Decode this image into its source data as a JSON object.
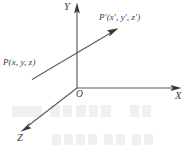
{
  "figure": {
    "kind": "3d-cartesian-coordinate-diagram",
    "background_color": "#ffffff",
    "line_color": "#5a5a5a",
    "text_color": "#3d3d3d",
    "width": 189,
    "height": 158
  },
  "axes": {
    "y": {
      "label": "Y",
      "direction": "up",
      "origin": {
        "x": 77,
        "y": 88
      },
      "tip": {
        "x": 77,
        "y": 4
      }
    },
    "x": {
      "label": "X",
      "direction": "right",
      "origin": {
        "x": 77,
        "y": 88
      },
      "tip": {
        "x": 181,
        "y": 88
      }
    },
    "z": {
      "label": "Z",
      "direction": "down-left",
      "origin": {
        "x": 77,
        "y": 88
      },
      "tip": {
        "x": 21,
        "y": 131
      }
    }
  },
  "origin": {
    "label": "O",
    "x": 77,
    "y": 88
  },
  "points": {
    "p": {
      "label": "P(x, y, z)",
      "name": "P",
      "coordinates": "(x, y, z)"
    },
    "p_prime": {
      "label": "P′(x′, y′, z′)",
      "name": "P′",
      "coordinates": "(x′, y′, z′)"
    }
  },
  "vector": {
    "description": "arrow from P to P-prime",
    "from": {
      "x": 32,
      "y": 79
    },
    "to": {
      "x": 118,
      "y": 28
    },
    "arrow_at": "to"
  }
}
